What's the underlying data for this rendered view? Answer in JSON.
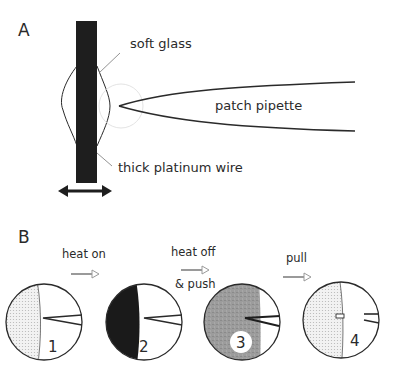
{
  "panel_a": {
    "label": "A",
    "labels": {
      "soft_glass": "soft glass",
      "patch_pipette": "patch pipette",
      "thick_platinum_wire": "thick platinum wire"
    },
    "icons": [
      "double-headed-arrow-icon"
    ]
  },
  "panel_b": {
    "label": "B",
    "steps": [
      {
        "number": "1",
        "state": "dotted glass left, pipette tip near boundary"
      },
      {
        "number": "2",
        "state": "dark heated glass left, pipette tip near boundary"
      },
      {
        "number": "3",
        "state": "grey glass fills most, pipette tip pushed in"
      },
      {
        "number": "4",
        "state": "dotted glass left, pipette pulled back, broken tip remains"
      }
    ],
    "transitions": [
      {
        "label": "heat on"
      },
      {
        "label": "heat off",
        "label2": "& push"
      },
      {
        "label": "pull"
      }
    ],
    "icons": [
      "right-arrow-icon"
    ]
  },
  "colors": {
    "line": "#2a2a2a",
    "wire": "#1e1e1e",
    "dark_glass": "#1a1a1a",
    "grey_glass": "#9a9a9a",
    "dotted_glass": "#e4e4e4",
    "arrow_grey": "#9a9a9a",
    "faint_circle": "#dcdcdc"
  }
}
